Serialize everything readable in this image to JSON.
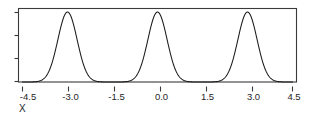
{
  "chart_data": {
    "type": "line",
    "title": "",
    "subtitle": "",
    "xlabel": "X",
    "ylabel": "",
    "xlim": [
      -4.5,
      4.5
    ],
    "ylim": [
      0,
      1.05
    ],
    "grid": false,
    "legend": null,
    "x_ticks": [
      -4.5,
      -3.0,
      -1.5,
      0.0,
      1.5,
      3.0,
      4.5
    ],
    "x_tick_labels": [
      "-4.5",
      "-3.0",
      "-1.5",
      "0.0",
      "1.5",
      "3.0",
      "4.5"
    ],
    "y_ticks": [
      0.0,
      0.3333,
      0.6667,
      1.0
    ],
    "y_tick_labels": [
      "",
      "",
      "",
      ""
    ],
    "series": [
      {
        "name": "trimodal density",
        "description": "Sum of three equal Gaussian peaks",
        "peaks": [
          {
            "center": -3.0,
            "height": 1.0,
            "sigma": 0.32
          },
          {
            "center": 0.0,
            "height": 1.0,
            "sigma": 0.32
          },
          {
            "center": 3.0,
            "height": 1.0,
            "sigma": 0.32
          }
        ]
      }
    ],
    "annotations": []
  },
  "axis": {
    "x_label": "X",
    "tick_labels": {
      "t0": "-4.5",
      "t1": "-3.0",
      "t2": "-1.5",
      "t3": "0.0",
      "t4": "1.5",
      "t5": "3.0",
      "t6": "4.5"
    }
  },
  "colors": {
    "curve": "#1a1a1a",
    "frame": "#3a3a3a",
    "text": "#262626",
    "background": "#ffffff"
  }
}
